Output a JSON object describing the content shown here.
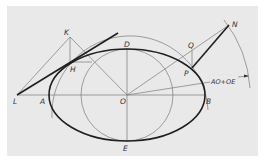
{
  "diagram": {
    "colors": {
      "background": "#e9e9e9",
      "margin": "#ffffff",
      "line_thin": "#7a7a7a",
      "line_thick": "#1f1f1f",
      "label": "#333333"
    },
    "points": {
      "K": "K",
      "D": "D",
      "N": "N",
      "Q": "Q",
      "H": "H",
      "P": "P",
      "L": "L",
      "A": "A",
      "O": "O",
      "B": "B",
      "E": "E"
    },
    "annotation": "AO+OE"
  }
}
